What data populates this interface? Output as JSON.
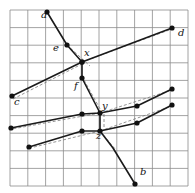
{
  "figure": {
    "canvas": {
      "width": 195,
      "height": 193,
      "background": "#ffffff"
    },
    "grid": {
      "x0": 10,
      "y0": 10,
      "x1": 188,
      "y1": 186,
      "cols": 10,
      "rows": 10,
      "cell_w": 17.8,
      "cell_h": 17.6,
      "line_color": "#8c8c8c",
      "line_width": 0.8,
      "visible": true
    },
    "style": {
      "solid_color": "#1a1a1a",
      "solid_width": 1.6,
      "dashed_color": "#7a7a7a",
      "dashed_width": 0.8,
      "dash_pattern": "3,2",
      "dot_color": "#9a9a9a",
      "dot_pattern": "1,2",
      "vertex_color": "#111111",
      "vertex_radius": 2.6,
      "label_color": "#111111",
      "label_size": 10
    },
    "labels": [
      {
        "id": "label-a",
        "text": "a",
        "x": 41,
        "y": 19
      },
      {
        "id": "label-b",
        "text": "b",
        "x": 140,
        "y": 176
      },
      {
        "id": "label-c",
        "text": "c",
        "x": 14,
        "y": 106
      },
      {
        "id": "label-d",
        "text": "d",
        "x": 178,
        "y": 37
      },
      {
        "id": "label-e",
        "text": "e",
        "x": 53,
        "y": 52
      },
      {
        "id": "label-f",
        "text": "f",
        "x": 74,
        "y": 90
      },
      {
        "id": "label-x",
        "text": "x",
        "x": 84,
        "y": 57
      },
      {
        "id": "label-y",
        "text": "y",
        "x": 102,
        "y": 110
      },
      {
        "id": "label-z",
        "text": "z",
        "x": 96,
        "y": 140
      }
    ],
    "vertices": [
      {
        "id": "vertex-a",
        "x": 47,
        "y": 12
      },
      {
        "id": "vertex-e",
        "x": 67,
        "y": 45
      },
      {
        "id": "vertex-x",
        "x": 82,
        "y": 62
      },
      {
        "id": "vertex-f",
        "x": 82,
        "y": 78
      },
      {
        "id": "vertex-y",
        "x": 100,
        "y": 113
      },
      {
        "id": "vertex-z",
        "x": 100,
        "y": 131
      },
      {
        "id": "vertex-b",
        "x": 135,
        "y": 184
      },
      {
        "id": "vertex-c",
        "x": 12,
        "y": 96
      },
      {
        "id": "vertex-d",
        "x": 172,
        "y": 28
      },
      {
        "id": "vertex-mid-upper-left",
        "x": 82,
        "y": 62
      },
      {
        "id": "vertex-lowleft-1",
        "x": 11,
        "y": 128
      },
      {
        "id": "vertex-lowleft-2",
        "x": 82,
        "y": 114
      },
      {
        "id": "vertex-lowleft-3",
        "x": 29,
        "y": 147
      },
      {
        "id": "vertex-lowleft-4",
        "x": 82,
        "y": 131
      },
      {
        "id": "vertex-right-1",
        "x": 137,
        "y": 106
      },
      {
        "id": "vertex-right-2",
        "x": 172,
        "y": 89
      },
      {
        "id": "vertex-right-3",
        "x": 137,
        "y": 123
      },
      {
        "id": "vertex-right-4",
        "x": 172,
        "y": 105
      }
    ],
    "solid_paths": [
      {
        "id": "path-a-e-x-f-y-z-b",
        "name": "chain-a-to-b",
        "points": [
          [
            47,
            12
          ],
          [
            67,
            45
          ],
          [
            82,
            62
          ],
          [
            82,
            78
          ],
          [
            100,
            113
          ],
          [
            100,
            131
          ],
          [
            113,
            148
          ],
          [
            135,
            184
          ]
        ]
      },
      {
        "id": "path-c-x-d",
        "name": "chain-c-to-d",
        "points": [
          [
            12,
            96
          ],
          [
            82,
            62
          ],
          [
            172,
            28
          ]
        ]
      },
      {
        "id": "path-lowleft-upper",
        "name": "chain-left-mid-to-right-upper",
        "points": [
          [
            11,
            128
          ],
          [
            82,
            114
          ],
          [
            100,
            113
          ],
          [
            137,
            106
          ],
          [
            172,
            89
          ]
        ]
      },
      {
        "id": "path-lowleft-lower",
        "name": "chain-left-low-to-right-lower",
        "points": [
          [
            29,
            147
          ],
          [
            82,
            131
          ],
          [
            100,
            131
          ],
          [
            137,
            123
          ],
          [
            172,
            105
          ]
        ]
      }
    ],
    "dashed_paths": [
      {
        "id": "dash-e-x",
        "name": "guide-e-to-x",
        "points": [
          [
            67,
            45
          ],
          [
            90,
            66
          ]
        ]
      },
      {
        "id": "dash-x-d",
        "name": "guide-x-to-d",
        "points": [
          [
            82,
            62
          ],
          [
            172,
            29
          ]
        ]
      },
      {
        "id": "dash-c-x",
        "name": "guide-c-to-x",
        "points": [
          [
            13,
            99
          ],
          [
            82,
            64
          ]
        ]
      },
      {
        "id": "dash-y-upper",
        "name": "guide-y-right-upper",
        "points": [
          [
            100,
            113
          ],
          [
            172,
            90
          ]
        ]
      },
      {
        "id": "dash-y-left",
        "name": "guide-y-left",
        "points": [
          [
            100,
            113
          ],
          [
            12,
            129
          ]
        ]
      },
      {
        "id": "dash-z-right",
        "name": "guide-z-right",
        "points": [
          [
            100,
            131
          ],
          [
            172,
            106
          ]
        ]
      },
      {
        "id": "dash-z-left",
        "name": "guide-z-left",
        "points": [
          [
            100,
            131
          ],
          [
            30,
            148
          ]
        ]
      },
      {
        "id": "dash-f-y",
        "name": "guide-f-to-y",
        "points": [
          [
            84,
            80
          ],
          [
            104,
            116
          ]
        ]
      },
      {
        "id": "dash-z-b",
        "name": "guide-z-to-b",
        "points": [
          [
            100,
            131
          ],
          [
            116,
            150
          ]
        ]
      },
      {
        "id": "dash-y-z",
        "name": "guide-y-to-z",
        "points": [
          [
            104,
            114
          ],
          [
            104,
            130
          ]
        ]
      }
    ]
  }
}
